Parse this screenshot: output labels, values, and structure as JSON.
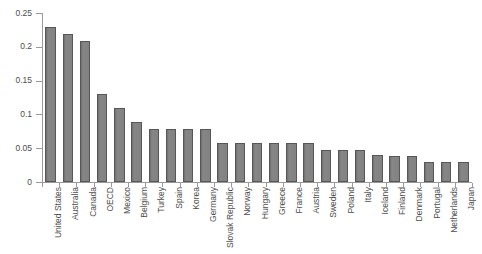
{
  "chart_data": {
    "type": "bar",
    "title": "",
    "subtitle": "",
    "xlabel": "",
    "ylabel": "",
    "ylim": [
      0,
      0.25
    ],
    "yticks": [
      0,
      0.05,
      0.1,
      0.15,
      0.2,
      0.25
    ],
    "ytick_labels": [
      "0",
      "0.05",
      "0.1",
      "0.15",
      "0.2",
      "0.25"
    ],
    "grid": false,
    "legend": false,
    "legend_position": "none",
    "orientation": "vertical",
    "categories": [
      "United States",
      "Australia",
      "Canada",
      "OECD",
      "Mexico",
      "Belgium",
      "Turkey",
      "Spain",
      "Korea",
      "Germany",
      "Slovak Republic",
      "Norway",
      "Hungary",
      "Greece",
      "France",
      "Austria",
      "Sweden",
      "Poland",
      "Italy",
      "Iceland",
      "Finland",
      "Denmark",
      "Portugal",
      "Netherlands",
      "Japan"
    ],
    "values": [
      0.229,
      0.219,
      0.209,
      0.13,
      0.109,
      0.089,
      0.078,
      0.078,
      0.078,
      0.078,
      0.058,
      0.058,
      0.058,
      0.058,
      0.058,
      0.058,
      0.048,
      0.048,
      0.048,
      0.04,
      0.039,
      0.039,
      0.03,
      0.029,
      0.029
    ],
    "bar_color": "#7d7d7d",
    "bar_edge_color": "#575757",
    "axis_color": "#9a9a9a",
    "text_color": "#4d4d4d",
    "background_color": "#ffffff",
    "label_rotation": -90
  }
}
